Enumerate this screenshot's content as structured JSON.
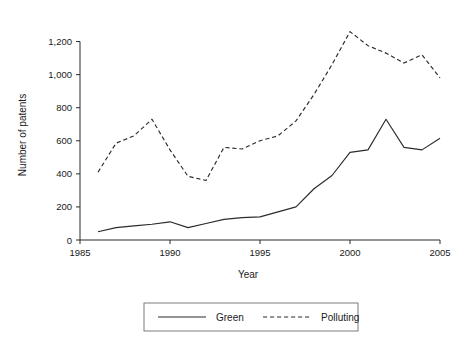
{
  "chart_data": {
    "type": "line",
    "title": "",
    "xlabel": "Year",
    "ylabel": "Number of patents",
    "xlim": [
      1985,
      2005
    ],
    "ylim": [
      0,
      1300
    ],
    "xticks": [
      "1985",
      "1990",
      "1995",
      "2000",
      "2005"
    ],
    "xtick_values": [
      1985,
      1990,
      1995,
      2000,
      2005
    ],
    "yticks": [
      "0",
      "200",
      "400",
      "600",
      "800",
      "1,000",
      "1,200"
    ],
    "ytick_values": [
      0,
      200,
      400,
      600,
      800,
      1000,
      1200
    ],
    "grid": false,
    "legend_position": "below",
    "x": [
      1986,
      1987,
      1988,
      1989,
      1990,
      1991,
      1992,
      1993,
      1994,
      1995,
      1996,
      1997,
      1998,
      1999,
      2000,
      2001,
      2002,
      2003,
      2004,
      2005
    ],
    "series": [
      {
        "name": "Green",
        "style": "solid",
        "color": "#2b2b2b",
        "values": [
          50,
          75,
          85,
          95,
          110,
          75,
          100,
          125,
          135,
          140,
          170,
          200,
          310,
          390,
          530,
          545,
          730,
          560,
          545,
          615
        ]
      },
      {
        "name": "Polluting",
        "style": "dashed",
        "color": "#2b2b2b",
        "values": [
          410,
          585,
          630,
          730,
          545,
          385,
          360,
          560,
          550,
          600,
          630,
          720,
          880,
          1060,
          1260,
          1175,
          1130,
          1070,
          1120,
          980
        ]
      }
    ]
  },
  "legend": {
    "items": [
      {
        "label": "Green",
        "style": "solid"
      },
      {
        "label": "Polluting",
        "style": "dashed"
      }
    ]
  }
}
